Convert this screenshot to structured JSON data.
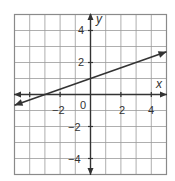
{
  "chart_data": {
    "type": "line",
    "title": "",
    "xlabel": "x",
    "ylabel": "y",
    "xlim": [
      -5,
      5
    ],
    "ylim": [
      -5,
      5
    ],
    "grid": true,
    "x_tick_labels": [
      "-2",
      "0",
      "2",
      "4"
    ],
    "y_tick_labels": [
      "4",
      "2",
      "-2",
      "-4"
    ],
    "origin_label": "0",
    "series": [
      {
        "name": "line",
        "equation": "y = x/3 + 1",
        "slope": 0.3333,
        "y_intercept": 1,
        "x_intercept": -3,
        "x": [
          -5,
          5
        ],
        "y": [
          -0.67,
          2.67
        ],
        "arrows": "both"
      }
    ]
  },
  "labels": {
    "x_axis": "x",
    "y_axis": "y",
    "origin": "0",
    "xt_m2": "−2",
    "xt_2": "2",
    "xt_4": "4",
    "yt_4": "4",
    "yt_2": "2",
    "yt_m2": "−2",
    "yt_m4": "−4"
  },
  "colors": {
    "grid": "#9a9a9a",
    "axis": "#333333",
    "line": "#333333",
    "frame": "#8a8a8a"
  }
}
